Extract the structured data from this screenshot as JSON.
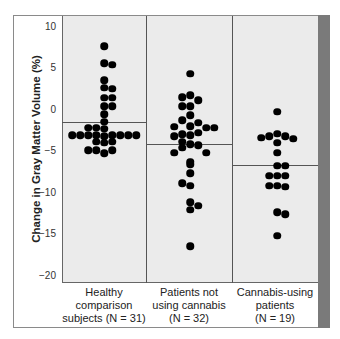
{
  "chart_data": {
    "type": "scatter",
    "subtype": "dot-plot (beeswarm) with group means",
    "title": "",
    "xlabel": "",
    "ylabel": "Change in Gray Matter Volume (%)",
    "ylim": [
      -20,
      10
    ],
    "yticks": [
      10,
      5,
      0,
      -5,
      -10,
      -15,
      -20
    ],
    "grid": false,
    "legend": null,
    "categories": [
      "Healthy comparison subjects (N=31)",
      "Patients not using cannabis (N=32)",
      "Cannabis-using patients (N=19)"
    ],
    "series": [
      {
        "name": "Healthy comparison subjects",
        "n": 31,
        "mean": -1.5,
        "label_lines": [
          "Healthy",
          "comparison",
          "subjects (N = 31)"
        ],
        "points": [
          {
            "y": 7.6,
            "dx": 0
          },
          {
            "y": 5.6,
            "dx": 0
          },
          {
            "y": 5.4,
            "dx": 8
          },
          {
            "y": 3.5,
            "dx": 0
          },
          {
            "y": 2.6,
            "dx": 0
          },
          {
            "y": 2.5,
            "dx": 8
          },
          {
            "y": 1.4,
            "dx": 0
          },
          {
            "y": 1.4,
            "dx": 8
          },
          {
            "y": 0.4,
            "dx": 0
          },
          {
            "y": 0.4,
            "dx": 8
          },
          {
            "y": -0.6,
            "dx": 0
          },
          {
            "y": -1.5,
            "dx": 0
          },
          {
            "y": -2.2,
            "dx": -16
          },
          {
            "y": -2.2,
            "dx": -8
          },
          {
            "y": -2.3,
            "dx": 0
          },
          {
            "y": -3.1,
            "dx": -32
          },
          {
            "y": -3.1,
            "dx": -24
          },
          {
            "y": -3.1,
            "dx": -16
          },
          {
            "y": -3.1,
            "dx": -8
          },
          {
            "y": -3.2,
            "dx": 0
          },
          {
            "y": -3.1,
            "dx": 8
          },
          {
            "y": -3.1,
            "dx": 16
          },
          {
            "y": -3.1,
            "dx": 24
          },
          {
            "y": -3.1,
            "dx": 32
          },
          {
            "y": -3.9,
            "dx": -8
          },
          {
            "y": -4.0,
            "dx": 0
          },
          {
            "y": -3.9,
            "dx": 8
          },
          {
            "y": -4.9,
            "dx": -16
          },
          {
            "y": -4.9,
            "dx": -8
          },
          {
            "y": -5.3,
            "dx": 0
          },
          {
            "y": -4.9,
            "dx": 8
          }
        ]
      },
      {
        "name": "Patients not using cannabis",
        "n": 32,
        "mean": -4.2,
        "label_lines": [
          "Patients not",
          "using cannabis",
          "(N = 32)"
        ],
        "points": [
          {
            "y": 4.3,
            "dx": 0
          },
          {
            "y": 1.5,
            "dx": -8
          },
          {
            "y": 1.7,
            "dx": 0
          },
          {
            "y": 1.1,
            "dx": 8
          },
          {
            "y": 0.4,
            "dx": -8
          },
          {
            "y": 0.4,
            "dx": 0
          },
          {
            "y": -0.7,
            "dx": 0
          },
          {
            "y": -1.3,
            "dx": -8
          },
          {
            "y": -1.6,
            "dx": 8
          },
          {
            "y": -2.1,
            "dx": -16
          },
          {
            "y": -2.0,
            "dx": 0
          },
          {
            "y": -2.2,
            "dx": 16
          },
          {
            "y": -2.2,
            "dx": 24
          },
          {
            "y": -2.8,
            "dx": 8
          },
          {
            "y": -3.2,
            "dx": -16
          },
          {
            "y": -3.0,
            "dx": -8
          },
          {
            "y": -3.1,
            "dx": 0
          },
          {
            "y": -3.9,
            "dx": -8
          },
          {
            "y": -4.6,
            "dx": -8
          },
          {
            "y": -4.2,
            "dx": 0
          },
          {
            "y": -4.3,
            "dx": 8
          },
          {
            "y": -5.2,
            "dx": -16
          },
          {
            "y": -5.2,
            "dx": 16
          },
          {
            "y": -6.3,
            "dx": 0
          },
          {
            "y": -6.6,
            "dx": 0
          },
          {
            "y": -7.7,
            "dx": 0
          },
          {
            "y": -8.9,
            "dx": -8
          },
          {
            "y": -9.2,
            "dx": 0
          },
          {
            "y": -11.2,
            "dx": 0
          },
          {
            "y": -11.6,
            "dx": 8
          },
          {
            "y": -12.1,
            "dx": 0
          },
          {
            "y": -16.5,
            "dx": 0
          }
        ]
      },
      {
        "name": "Cannabis-using patients",
        "n": 19,
        "mean": -6.7,
        "label_lines": [
          "Cannabis-using",
          "patients",
          "(N = 19)"
        ],
        "points": [
          {
            "y": -0.3,
            "dx": 0
          },
          {
            "y": -3.4,
            "dx": -16
          },
          {
            "y": -3.2,
            "dx": -8
          },
          {
            "y": -2.9,
            "dx": 0
          },
          {
            "y": -3.2,
            "dx": 8
          },
          {
            "y": -3.5,
            "dx": 16
          },
          {
            "y": -4.0,
            "dx": 0
          },
          {
            "y": -5.2,
            "dx": 0
          },
          {
            "y": -6.8,
            "dx": 0
          },
          {
            "y": -6.8,
            "dx": 8
          },
          {
            "y": -8.0,
            "dx": -8
          },
          {
            "y": -8.0,
            "dx": 0
          },
          {
            "y": -8.0,
            "dx": 8
          },
          {
            "y": -9.2,
            "dx": -8
          },
          {
            "y": -9.2,
            "dx": 0
          },
          {
            "y": -9.3,
            "dx": 8
          },
          {
            "y": -12.4,
            "dx": 0
          },
          {
            "y": -12.6,
            "dx": 8
          },
          {
            "y": -15.2,
            "dx": 0
          }
        ]
      }
    ]
  },
  "colors": {
    "plot_background": "#ebebeb",
    "dot": "#000000",
    "frame": "#8a8a8a",
    "accent_bar": "#7a7a7a",
    "mean_line": "#555555"
  }
}
